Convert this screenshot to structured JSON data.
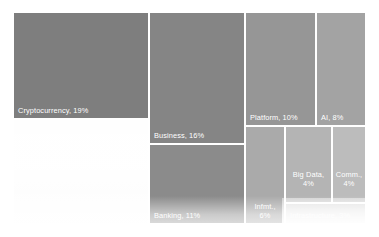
{
  "chart_data": {
    "type": "treemap",
    "title": "",
    "xlabel": "",
    "ylabel": "",
    "legend": "none",
    "grid": false,
    "categories": [
      "Cryptocurrency",
      "Business",
      "Banking",
      "Platform",
      "AI",
      "Infmt.",
      "Big Data",
      "Comm.",
      "Infrastructure"
    ],
    "values": [
      19,
      16,
      11,
      10,
      8,
      6,
      4,
      4,
      3
    ],
    "value_unit": "%",
    "tiles": [
      {
        "name": "cryptocurrency",
        "label": "Cryptocurrency, 19%",
        "category": "Cryptocurrency",
        "value": 19,
        "color": "#7e7e7e",
        "x": 0,
        "y": 0,
        "w": 134,
        "h": 105,
        "label_style": "inline",
        "faded": false
      },
      {
        "name": "pale-block",
        "label": "",
        "category": "",
        "value": null,
        "color": "#f7f7f7",
        "x": 0,
        "y": 107,
        "w": 134,
        "h": 103,
        "label_style": "inline",
        "faded": true
      },
      {
        "name": "business",
        "label": "Business, 16%",
        "category": "Business",
        "value": 16,
        "color": "#858585",
        "x": 136,
        "y": 0,
        "w": 94,
        "h": 130,
        "label_style": "inline",
        "faded": false
      },
      {
        "name": "banking",
        "label": "Banking, 11%",
        "category": "Banking",
        "value": 11,
        "color": "#8b8b8b",
        "x": 136,
        "y": 132,
        "w": 94,
        "h": 78,
        "label_style": "inline",
        "faded": false
      },
      {
        "name": "platform",
        "label": "Platform, 10%",
        "category": "Platform",
        "value": 10,
        "color": "#969696",
        "x": 232,
        "y": 0,
        "w": 69,
        "h": 112,
        "label_style": "inline",
        "faded": false
      },
      {
        "name": "ai",
        "label": "AI, 8%",
        "category": "AI",
        "value": 8,
        "color": "#a3a3a3",
        "x": 303,
        "y": 0,
        "w": 48,
        "h": 112,
        "label_style": "inline",
        "faded": false
      },
      {
        "name": "infmt",
        "label": "Infmt., 6%",
        "label_line1": "Infmt.,",
        "label_line2": "6%",
        "category": "Infmt.",
        "value": 6,
        "color": "#aaaaaa",
        "x": 232,
        "y": 114,
        "w": 38,
        "h": 96,
        "label_style": "stacked",
        "faded": false
      },
      {
        "name": "big-data",
        "label": "Big Data, 4%",
        "label_line1": "Big Data,",
        "label_line2": "4%",
        "category": "Big Data",
        "value": 4,
        "color": "#b4b4b4",
        "x": 272,
        "y": 114,
        "w": 45,
        "h": 75,
        "label_style": "stacked",
        "faded": false
      },
      {
        "name": "comm",
        "label": "Comm., 4%",
        "label_line1": "Comm.,",
        "label_line2": "4%",
        "category": "Comm.",
        "value": 4,
        "color": "#bcbcbc",
        "x": 319,
        "y": 114,
        "w": 32,
        "h": 75,
        "label_style": "stacked",
        "faded": false
      },
      {
        "name": "infrastructure",
        "label": "Infrastructure, 3%",
        "category": "Infrastructure",
        "value": 3,
        "color": "#c9c9c9",
        "x": 272,
        "y": 191,
        "w": 79,
        "h": 19,
        "label_style": "inline",
        "faded": true
      }
    ]
  }
}
